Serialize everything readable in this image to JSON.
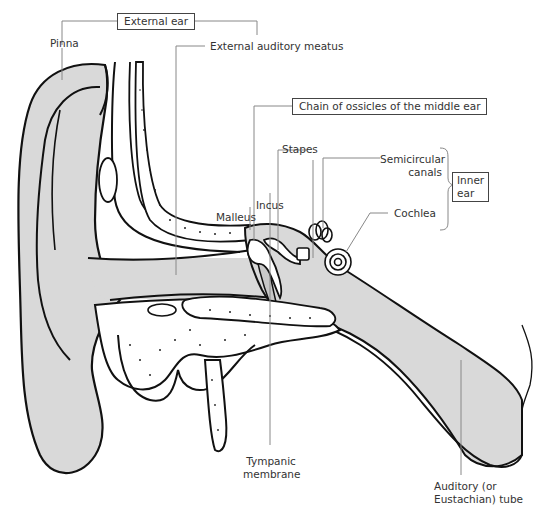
{
  "diagram": {
    "groups": {
      "external_ear": "External ear",
      "ossicles": "Chain of ossicles of the middle ear",
      "inner_ear_line1": "Inner",
      "inner_ear_line2": "ear"
    },
    "labels": {
      "pinna": "Pinna",
      "meatus": "External auditory meatus",
      "stapes": "Stapes",
      "incus": "Incus",
      "malleus": "Malleus",
      "semicircular_line1": "Semicircular",
      "semicircular_line2": "canals",
      "cochlea": "Cochlea",
      "tympanic_line1": "Tympanic",
      "tympanic_line2": "membrane",
      "auditory_line1": "Auditory (or",
      "auditory_line2": "Eustachian) tube"
    },
    "colors": {
      "fill_gray": "#d9d9d9",
      "outline": "#111111",
      "leader": "#888888",
      "background": "#ffffff"
    }
  }
}
